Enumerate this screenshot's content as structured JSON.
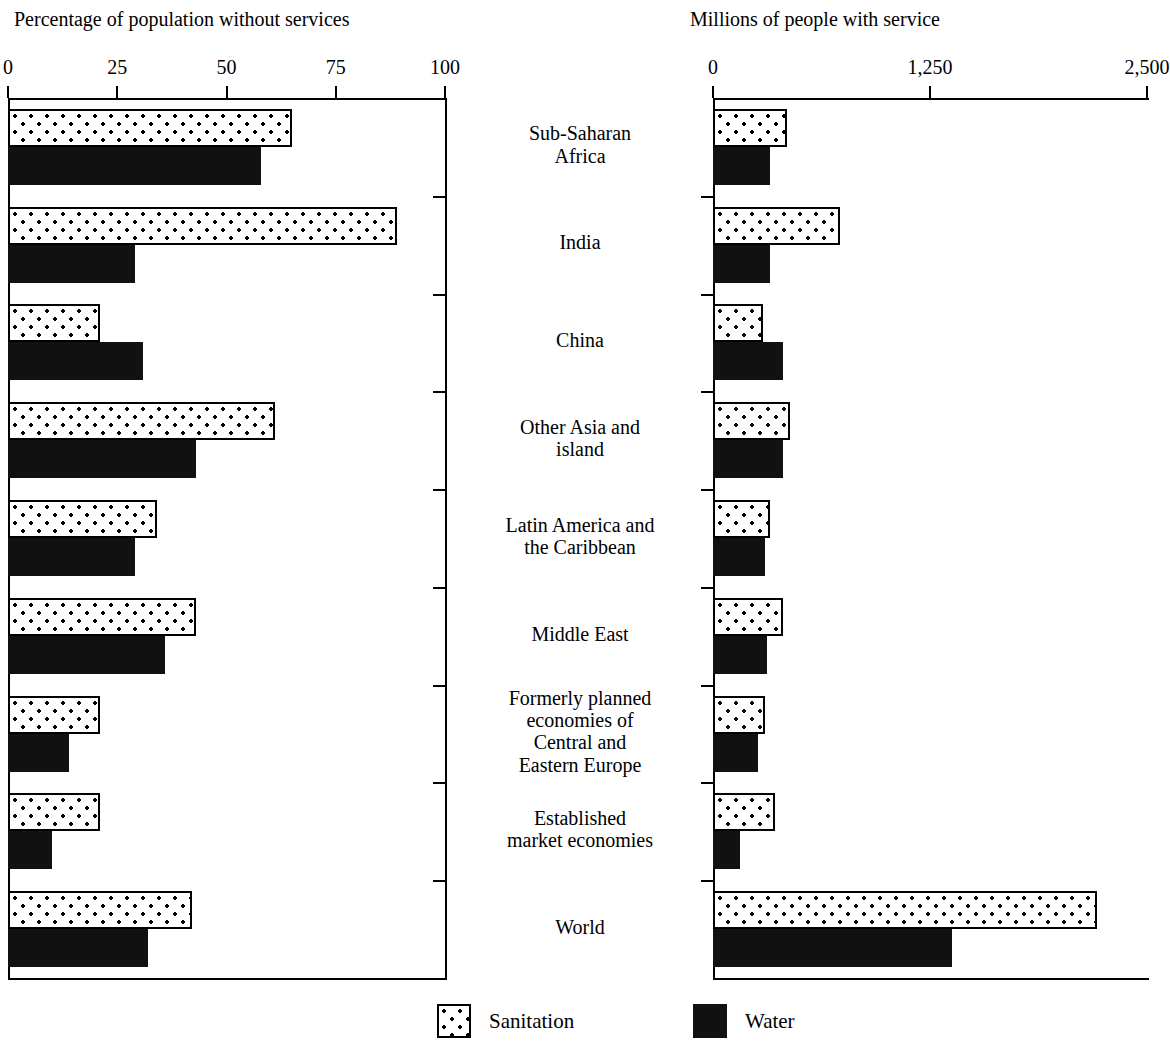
{
  "figure": {
    "left_panel_title": "Percentage of population without services",
    "right_panel_title": "Millions of people with service"
  },
  "legend": {
    "items": [
      {
        "key": "sanitation",
        "label": "Sanitation",
        "swatch": "dotted-white-square-icon",
        "color": "#ffffff"
      },
      {
        "key": "water",
        "label": "Water",
        "swatch": "solid-black-square-icon",
        "color": "#111111"
      }
    ]
  },
  "axes": {
    "left": {
      "labels": [
        "0",
        "25",
        "50",
        "75",
        "100"
      ],
      "values": [
        0,
        25,
        50,
        75,
        100
      ],
      "min": 0,
      "max": 100
    },
    "right": {
      "labels": [
        "0",
        "1,250",
        "2,500"
      ],
      "values": [
        0,
        1250,
        2500
      ],
      "min": 0,
      "max": 2500
    }
  },
  "categories": [
    {
      "lines": [
        "Sub-Saharan",
        "Africa"
      ]
    },
    {
      "lines": [
        "India"
      ]
    },
    {
      "lines": [
        "China"
      ]
    },
    {
      "lines": [
        "Other Asia and",
        "island"
      ]
    },
    {
      "lines": [
        "Latin America and",
        "the Caribbean"
      ]
    },
    {
      "lines": [
        "Middle East"
      ]
    },
    {
      "lines": [
        "Formerly planned",
        "economies of",
        "Central and",
        "Eastern Europe"
      ]
    },
    {
      "lines": [
        "Established",
        "market economies"
      ]
    },
    {
      "lines": [
        "World"
      ]
    }
  ],
  "chart_data": [
    {
      "type": "bar",
      "title": "Percentage of population without services",
      "orientation": "horizontal",
      "xlabel": "Percentage of population without services",
      "ylabel": "",
      "xlim": [
        0,
        100
      ],
      "xticks": [
        0,
        25,
        50,
        75,
        100
      ],
      "grid": false,
      "legend_position": "bottom-center",
      "categories": [
        "Sub-Saharan Africa",
        "India",
        "China",
        "Other Asia and island",
        "Latin America and the Caribbean",
        "Middle East",
        "Formerly planned economies of Central and Eastern Europe",
        "Established market economies",
        "World"
      ],
      "series": [
        {
          "name": "Sanitation",
          "values": [
            65,
            89,
            21,
            61,
            34,
            43,
            21,
            21,
            42
          ]
        },
        {
          "name": "Water",
          "values": [
            58,
            29,
            31,
            43,
            29,
            36,
            14,
            10,
            32
          ]
        }
      ]
    },
    {
      "type": "bar",
      "title": "Millions of people with service",
      "orientation": "horizontal",
      "xlabel": "Millions of people with service",
      "ylabel": "",
      "xlim": [
        0,
        2500
      ],
      "xticks": [
        0,
        1250,
        2500
      ],
      "grid": false,
      "legend_position": "bottom-center",
      "categories": [
        "Sub-Saharan Africa",
        "India",
        "China",
        "Other Asia and island",
        "Latin America and the Caribbean",
        "Middle East",
        "Formerly planned economies of Central and Eastern Europe",
        "Established market economies",
        "World"
      ],
      "series": [
        {
          "name": "Sanitation",
          "values": [
            426,
            732,
            288,
            443,
            328,
            403,
            300,
            357,
            2212
          ]
        },
        {
          "name": "Water",
          "values": [
            328,
            328,
            403,
            403,
            300,
            311,
            260,
            155,
            1377
          ]
        }
      ]
    }
  ]
}
